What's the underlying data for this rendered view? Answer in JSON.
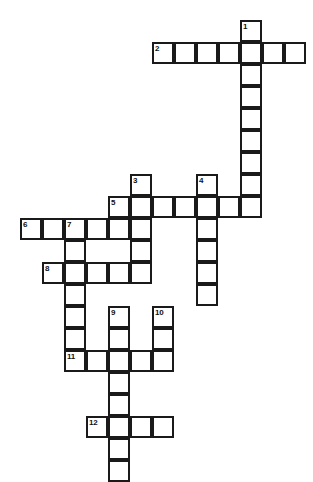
{
  "puzzle": {
    "title": "Crossword Puzzle Grid",
    "cell_size": 22,
    "origin_x": 20,
    "origin_y": 20,
    "border_color": "#1a1a1a",
    "cell_fill": "#ffffff",
    "background": "#ffffff",
    "width": 313,
    "height": 479,
    "columns": 13,
    "rows": 21
  },
  "entries": [
    {
      "number": "1",
      "direction": "down",
      "row": 0,
      "col": 10,
      "length": 9
    },
    {
      "number": "2",
      "direction": "across",
      "row": 1,
      "col": 6,
      "length": 7
    },
    {
      "number": "3",
      "direction": "down",
      "row": 7,
      "col": 5,
      "length": 5
    },
    {
      "number": "4",
      "direction": "down",
      "row": 7,
      "col": 8,
      "length": 6
    },
    {
      "number": "5",
      "direction": "across",
      "row": 8,
      "col": 4,
      "length": 7
    },
    {
      "number": "6",
      "direction": "across",
      "row": 9,
      "col": 0,
      "length": 4
    },
    {
      "number": "7",
      "direction": "down",
      "row": 9,
      "col": 2,
      "length": 7
    },
    {
      "number": "8",
      "direction": "across",
      "row": 11,
      "col": 1,
      "length": 5
    },
    {
      "number": "9",
      "direction": "down",
      "row": 13,
      "col": 4,
      "length": 8
    },
    {
      "number": "10",
      "direction": "down",
      "row": 13,
      "col": 6,
      "length": 3
    },
    {
      "number": "11",
      "direction": "across",
      "row": 15,
      "col": 2,
      "length": 5
    },
    {
      "number": "12",
      "direction": "across",
      "row": 18,
      "col": 3,
      "length": 4
    }
  ],
  "cells": [
    {
      "row": 0,
      "col": 10,
      "number": "1"
    },
    {
      "row": 1,
      "col": 6,
      "number": "2"
    },
    {
      "row": 1,
      "col": 7,
      "number": ""
    },
    {
      "row": 1,
      "col": 8,
      "number": ""
    },
    {
      "row": 1,
      "col": 9,
      "number": ""
    },
    {
      "row": 1,
      "col": 10,
      "number": ""
    },
    {
      "row": 1,
      "col": 11,
      "number": ""
    },
    {
      "row": 1,
      "col": 12,
      "number": ""
    },
    {
      "row": 2,
      "col": 10,
      "number": ""
    },
    {
      "row": 3,
      "col": 10,
      "number": ""
    },
    {
      "row": 4,
      "col": 10,
      "number": ""
    },
    {
      "row": 5,
      "col": 10,
      "number": ""
    },
    {
      "row": 6,
      "col": 10,
      "number": ""
    },
    {
      "row": 7,
      "col": 5,
      "number": "3"
    },
    {
      "row": 7,
      "col": 8,
      "number": "4"
    },
    {
      "row": 7,
      "col": 10,
      "number": ""
    },
    {
      "row": 8,
      "col": 4,
      "number": "5"
    },
    {
      "row": 8,
      "col": 5,
      "number": ""
    },
    {
      "row": 8,
      "col": 6,
      "number": ""
    },
    {
      "row": 8,
      "col": 7,
      "number": ""
    },
    {
      "row": 8,
      "col": 8,
      "number": ""
    },
    {
      "row": 8,
      "col": 9,
      "number": ""
    },
    {
      "row": 8,
      "col": 10,
      "number": ""
    },
    {
      "row": 9,
      "col": 0,
      "number": "6"
    },
    {
      "row": 9,
      "col": 1,
      "number": ""
    },
    {
      "row": 9,
      "col": 2,
      "number": "7"
    },
    {
      "row": 9,
      "col": 3,
      "number": ""
    },
    {
      "row": 9,
      "col": 4,
      "number": ""
    },
    {
      "row": 9,
      "col": 5,
      "number": ""
    },
    {
      "row": 9,
      "col": 8,
      "number": ""
    },
    {
      "row": 10,
      "col": 2,
      "number": ""
    },
    {
      "row": 10,
      "col": 5,
      "number": ""
    },
    {
      "row": 10,
      "col": 8,
      "number": ""
    },
    {
      "row": 11,
      "col": 1,
      "number": "8"
    },
    {
      "row": 11,
      "col": 2,
      "number": ""
    },
    {
      "row": 11,
      "col": 3,
      "number": ""
    },
    {
      "row": 11,
      "col": 4,
      "number": ""
    },
    {
      "row": 11,
      "col": 5,
      "number": ""
    },
    {
      "row": 11,
      "col": 8,
      "number": ""
    },
    {
      "row": 12,
      "col": 2,
      "number": ""
    },
    {
      "row": 12,
      "col": 8,
      "number": ""
    },
    {
      "row": 13,
      "col": 2,
      "number": ""
    },
    {
      "row": 13,
      "col": 4,
      "number": "9"
    },
    {
      "row": 13,
      "col": 6,
      "number": "10"
    },
    {
      "row": 14,
      "col": 2,
      "number": ""
    },
    {
      "row": 14,
      "col": 4,
      "number": ""
    },
    {
      "row": 14,
      "col": 6,
      "number": ""
    },
    {
      "row": 15,
      "col": 2,
      "number": "11"
    },
    {
      "row": 15,
      "col": 3,
      "number": ""
    },
    {
      "row": 15,
      "col": 4,
      "number": ""
    },
    {
      "row": 15,
      "col": 5,
      "number": ""
    },
    {
      "row": 15,
      "col": 6,
      "number": ""
    },
    {
      "row": 16,
      "col": 4,
      "number": ""
    },
    {
      "row": 17,
      "col": 4,
      "number": ""
    },
    {
      "row": 18,
      "col": 3,
      "number": "12"
    },
    {
      "row": 18,
      "col": 4,
      "number": ""
    },
    {
      "row": 18,
      "col": 5,
      "number": ""
    },
    {
      "row": 18,
      "col": 6,
      "number": ""
    },
    {
      "row": 19,
      "col": 4,
      "number": ""
    },
    {
      "row": 20,
      "col": 4,
      "number": ""
    }
  ]
}
